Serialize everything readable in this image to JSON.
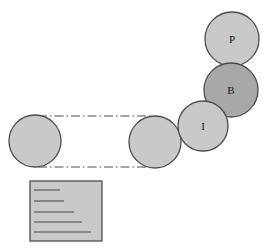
{
  "diagram": {
    "background": "#ffffff",
    "colors": {
      "circle_light": "#c9c9c9",
      "circle_dark": "#a8a8a8",
      "circle_stroke": "#4d4d4d",
      "rect_fill": "#c9c9c9",
      "rect_stroke": "#4d4d4d",
      "line_stroke": "#4d4d4d",
      "label_color": "#1a1a1a"
    },
    "circles": [
      {
        "id": "circle-p",
        "label": "P",
        "cx": 232,
        "cy": 39,
        "r": 27,
        "fill": "#c9c9c9",
        "tone": "light"
      },
      {
        "id": "circle-b",
        "label": "B",
        "cx": 231,
        "cy": 90,
        "r": 27,
        "fill": "#a8a8a8",
        "tone": "dark"
      },
      {
        "id": "circle-i",
        "label": "I",
        "cx": 203,
        "cy": 126,
        "r": 25,
        "fill": "#c9c9c9",
        "tone": "light"
      },
      {
        "id": "circle-mid",
        "label": "",
        "cx": 155,
        "cy": 142,
        "r": 26,
        "fill": "#c9c9c9",
        "tone": "light"
      },
      {
        "id": "circle-left",
        "label": "",
        "cx": 35,
        "cy": 141,
        "r": 26,
        "fill": "#c9c9c9",
        "tone": "light"
      }
    ],
    "dashdot_lines": [
      {
        "id": "band-line-top",
        "x1": 38,
        "y1": 116,
        "x2": 152,
        "y2": 116
      },
      {
        "id": "band-line-bottom",
        "x1": 38,
        "y1": 167,
        "x2": 152,
        "y2": 167
      }
    ],
    "rectangle": {
      "id": "striped-rectangle",
      "x": 30,
      "y": 181,
      "width": 72,
      "height": 60,
      "fill": "#c9c9c9",
      "stroke": "#4d4d4d"
    },
    "rectangle_lines": [
      {
        "id": "rect-line-1",
        "x1": 34,
        "y1": 190,
        "x2": 60,
        "y2": 190
      },
      {
        "id": "rect-line-2",
        "x1": 34,
        "y1": 201,
        "x2": 64,
        "y2": 201
      },
      {
        "id": "rect-line-3",
        "x1": 34,
        "y1": 212,
        "x2": 74,
        "y2": 212
      },
      {
        "id": "rect-line-4",
        "x1": 34,
        "y1": 222,
        "x2": 82,
        "y2": 222
      },
      {
        "id": "rect-line-5",
        "x1": 34,
        "y1": 232,
        "x2": 91,
        "y2": 232
      }
    ]
  }
}
